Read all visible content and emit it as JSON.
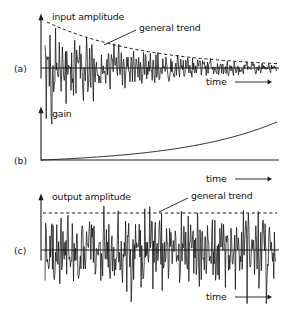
{
  "figure": {
    "title": "",
    "background_color": "#ffffff",
    "ink_color": "#1a1a1a",
    "width": 288,
    "height": 309
  },
  "panels": [
    {
      "id": "a",
      "panel_label": "(a)",
      "y_axis_label": "input amplitude",
      "x_axis_label": "time",
      "annotation_label": "general trend",
      "annotation_target": "decaying dashed envelope",
      "envelope_style": "dashed",
      "envelope_shape": "exponential decay",
      "arrow_glyph": "⟶"
    },
    {
      "id": "b",
      "panel_label": "(b)",
      "y_axis_label": "gain",
      "x_axis_label": "time",
      "annotation_label": "",
      "curve_style": "solid",
      "curve_shape": "exponential growth",
      "arrow_glyph": "⟶"
    },
    {
      "id": "c",
      "panel_label": "(c)",
      "y_axis_label": "output amplitude",
      "x_axis_label": "time",
      "annotation_label": "general trend",
      "annotation_target": "flat dashed envelope",
      "envelope_style": "dashed",
      "envelope_shape": "constant",
      "arrow_glyph": "⟶"
    }
  ],
  "chart_data": {
    "type": "line",
    "subplots": [
      {
        "id": "a",
        "title": "",
        "ylabel": "input amplitude",
        "xlabel": "time",
        "grid": false,
        "legend": "none",
        "xlim": [
          0,
          1
        ],
        "ylim": [
          -1.15,
          1.15
        ],
        "annotations": [
          {
            "text": "general trend",
            "points_to": "envelope",
            "x": 0.42,
            "y": 0.82
          }
        ],
        "series": [
          {
            "name": "general trend",
            "style": "dashed",
            "model": "envelope = exp(-2.35 * x)",
            "x": [
              0.0,
              0.1,
              0.2,
              0.3,
              0.4,
              0.5,
              0.6,
              0.7,
              0.8,
              0.9,
              1.0
            ],
            "values": [
              1.0,
              0.79,
              0.63,
              0.49,
              0.39,
              0.31,
              0.24,
              0.19,
              0.15,
              0.12,
              0.095
            ]
          },
          {
            "name": "input signal",
            "style": "solid",
            "model": "noisy oscillation modulated by decaying envelope",
            "description": "dense random oscillation whose peak amplitude decays from 1.0 to about 0.1"
          }
        ]
      },
      {
        "id": "b",
        "title": "",
        "ylabel": "gain",
        "xlabel": "time",
        "grid": false,
        "legend": "none",
        "xlim": [
          0,
          1
        ],
        "ylim": [
          0,
          1.05
        ],
        "annotations": [],
        "series": [
          {
            "name": "gain",
            "style": "solid",
            "model": "gain = (exp(2.35 * x) - 1) / (exp(2.35) - 1)",
            "x": [
              0.0,
              0.1,
              0.2,
              0.3,
              0.4,
              0.5,
              0.6,
              0.7,
              0.8,
              0.9,
              1.0
            ],
            "values": [
              0.0,
              0.03,
              0.07,
              0.12,
              0.185,
              0.266,
              0.37,
              0.502,
              0.669,
              0.88,
              1.0
            ]
          }
        ]
      },
      {
        "id": "c",
        "title": "",
        "ylabel": "output amplitude",
        "xlabel": "time",
        "grid": false,
        "legend": "none",
        "xlim": [
          0,
          1
        ],
        "ylim": [
          -1.15,
          1.15
        ],
        "annotations": [
          {
            "text": "general trend",
            "points_to": "envelope",
            "x": 0.58,
            "y": 1.0
          }
        ],
        "series": [
          {
            "name": "general trend",
            "style": "dashed",
            "model": "envelope = 1.0 (constant)",
            "x": [
              0.0,
              0.25,
              0.5,
              0.75,
              1.0
            ],
            "values": [
              1.0,
              1.0,
              1.0,
              1.0,
              1.0
            ]
          },
          {
            "name": "output signal",
            "style": "solid",
            "model": "input signal multiplied by gain, giving constant peak amplitude",
            "description": "dense random oscillation with roughly constant peak amplitude near 1.0"
          }
        ]
      }
    ]
  }
}
